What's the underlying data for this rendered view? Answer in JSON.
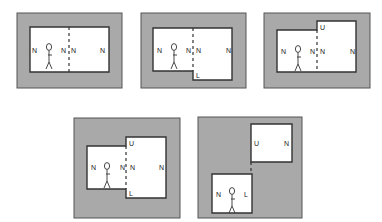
{
  "colors": {
    "wall": "#a9a9a9",
    "room": "#ffffff",
    "line": "#333333"
  },
  "panels": [
    {
      "id": "panel-1",
      "outer": [
        17,
        13,
        105,
        75
      ],
      "rooms": [
        "30,27 109,27 109,72 30,72"
      ],
      "dashes": [
        [
          69,
          27,
          69,
          72
        ]
      ],
      "labels": [
        {
          "text": "N",
          "x": 32,
          "y": 53
        },
        {
          "text": "N",
          "x": 61,
          "y": 53
        },
        {
          "text": "N",
          "x": 71,
          "y": 53
        },
        {
          "text": "N",
          "x": 100,
          "y": 53
        }
      ],
      "figure": {
        "x": 49,
        "y": 47
      }
    },
    {
      "id": "panel-2",
      "outer": [
        141,
        13,
        105,
        75
      ],
      "rooms": [
        "153,28 232,28 232,80 193,80 193,71 153,71"
      ],
      "dashes": [
        [
          193,
          28,
          193,
          71
        ]
      ],
      "labels": [
        {
          "text": "N",
          "x": 157,
          "y": 53
        },
        {
          "text": "N",
          "x": 186,
          "y": 53
        },
        {
          "text": "N",
          "x": 196,
          "y": 53
        },
        {
          "text": "N",
          "x": 226,
          "y": 53
        },
        {
          "text": "L",
          "x": 196,
          "y": 78
        }
      ],
      "figure": {
        "x": 174,
        "y": 47
      }
    },
    {
      "id": "panel-3",
      "outer": [
        264,
        13,
        106,
        75
      ],
      "rooms": [
        "277,30 317,30 317,21 356,21 356,72 277,72"
      ],
      "dashes": [
        [
          317,
          30,
          317,
          72
        ]
      ],
      "labels": [
        {
          "text": "N",
          "x": 281,
          "y": 54
        },
        {
          "text": "N",
          "x": 310,
          "y": 54
        },
        {
          "text": "N",
          "x": 320,
          "y": 54
        },
        {
          "text": "N",
          "x": 350,
          "y": 54
        },
        {
          "text": "U",
          "x": 320,
          "y": 30
        }
      ],
      "figure": {
        "x": 298,
        "y": 49
      }
    },
    {
      "id": "panel-4",
      "outer": [
        74,
        118,
        106,
        100
      ],
      "rooms": [
        "87,146 126,146 126,137 166,137 166,198 126,198 126,189 87,189"
      ],
      "dashes": [
        [
          126,
          146,
          126,
          189
        ]
      ],
      "labels": [
        {
          "text": "N",
          "x": 91,
          "y": 170
        },
        {
          "text": "N",
          "x": 120,
          "y": 170
        },
        {
          "text": "N",
          "x": 130,
          "y": 170
        },
        {
          "text": "N",
          "x": 159,
          "y": 170
        },
        {
          "text": "U",
          "x": 129,
          "y": 146
        },
        {
          "text": "L",
          "x": 129,
          "y": 196
        }
      ],
      "figure": {
        "x": 107,
        "y": 166
      }
    },
    {
      "id": "panel-5",
      "outer": [
        198,
        117,
        104,
        101
      ],
      "rooms": [
        "251,124 292,124 292,162 251,162",
        "212,174 252,174 252,213 212,213"
      ],
      "dashes": [
        [
          251,
          162,
          251,
          174
        ]
      ],
      "labels": [
        {
          "text": "U",
          "x": 254,
          "y": 146
        },
        {
          "text": "N",
          "x": 284,
          "y": 146
        },
        {
          "text": "N",
          "x": 216,
          "y": 197
        },
        {
          "text": "L",
          "x": 244,
          "y": 197
        }
      ],
      "figure": {
        "x": 232,
        "y": 191
      }
    }
  ]
}
